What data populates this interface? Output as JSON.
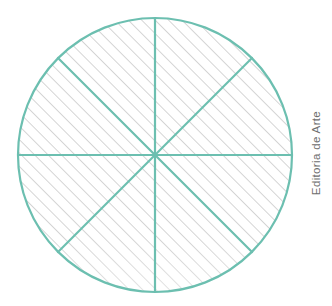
{
  "figure": {
    "credit": "Editoria de Arte",
    "colors": {
      "stroke": "#6cbfb0",
      "hatch": "#b3b3b3",
      "fill": "#ffffff",
      "credit_text": "#6e6e6e",
      "background": "#ffffff"
    }
  },
  "chart_data": {
    "type": "pie",
    "title": "",
    "subtitle": "",
    "xlabel": "",
    "ylabel": "",
    "annotations": [
      "Editoria de Arte"
    ],
    "legend": [],
    "grid": false,
    "circle": {
      "center_x": 155,
      "center_y": 155,
      "radius": 137,
      "stroke_width": 2.2,
      "stroke_color": "#6cbfb0",
      "fill_color": "#ffffff"
    },
    "hatch": {
      "pattern": "diagonal-45-up",
      "spacing_px": 9.5,
      "angle_deg": 45,
      "color": "#b3b3b3",
      "stroke_width": 1.1
    },
    "sectors": 8,
    "slice_labels": [
      "1",
      "2",
      "3",
      "4",
      "5",
      "6",
      "7",
      "8"
    ],
    "values": [
      12.5,
      12.5,
      12.5,
      12.5,
      12.5,
      12.5,
      12.5,
      12.5
    ],
    "categories": [
      "45°",
      "90°",
      "135°",
      "180°",
      "225°",
      "270°",
      "315°",
      "360°"
    ],
    "diameters": [
      {
        "name": "vertical-diameter",
        "angle_deg": 90,
        "x1": 155,
        "y1": 18,
        "x2": 155,
        "y2": 292
      },
      {
        "name": "horizontal-diameter",
        "angle_deg": 0,
        "x1": 18,
        "y1": 155,
        "x2": 292,
        "y2": 155
      },
      {
        "name": "diagonal-diameter-nw-se",
        "angle_deg": 135,
        "x1": 58,
        "y1": 58,
        "x2": 252,
        "y2": 252
      },
      {
        "name": "diagonal-diameter-ne-sw",
        "angle_deg": 45,
        "x1": 252,
        "y1": 58,
        "x2": 58,
        "y2": 252
      }
    ]
  }
}
